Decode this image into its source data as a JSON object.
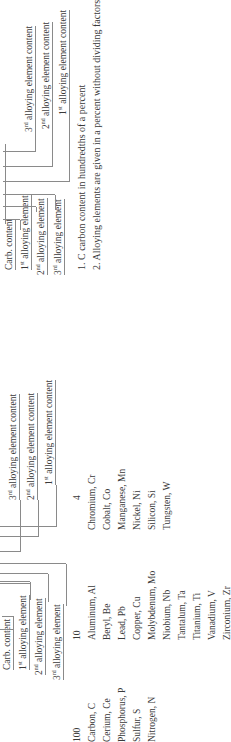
{
  "left_diagram": {
    "carb_content": "Carb. content",
    "element_labels": [
      {
        "ordinal": "1",
        "suffix": "st",
        "text": "alloying element"
      },
      {
        "ordinal": "2",
        "suffix": "nd",
        "text": "alloying element"
      },
      {
        "ordinal": "3",
        "suffix": "rd",
        "text": "alloying element"
      }
    ],
    "content_labels": [
      {
        "ordinal": "3",
        "suffix": "rd",
        "text": "alloying element content"
      },
      {
        "ordinal": "2",
        "suffix": "nd",
        "text": "alloying element content"
      },
      {
        "ordinal": "1",
        "suffix": "st",
        "text": "alloying element content"
      }
    ]
  },
  "right_diagram": {
    "carb_content": "Carb. content",
    "element_labels": [
      {
        "ordinal": "1",
        "suffix": "st",
        "text": "alloying element"
      },
      {
        "ordinal": "2",
        "suffix": "nd",
        "text": "alloying element"
      },
      {
        "ordinal": "3",
        "suffix": "rd",
        "text": "alloying element"
      }
    ],
    "content_labels": [
      {
        "ordinal": "3",
        "suffix": "rd",
        "text": "alloying element content"
      },
      {
        "ordinal": "2",
        "suffix": "nd",
        "text": "alloying element content"
      },
      {
        "ordinal": "1",
        "suffix": "st",
        "text": "alloying element content"
      }
    ]
  },
  "factor_columns": [
    {
      "factor": "100",
      "elements": [
        "Carbon, C",
        "Cerium, Ce",
        "Phosphorus, P",
        "Sulfur, S",
        "Nitrogen, N"
      ]
    },
    {
      "factor": "10",
      "elements": [
        "Aluminum, Al",
        "Beryl, Be",
        "Lead, Pb",
        "Copper, Cu",
        "Molybdenum, Mo",
        "Niobium, Nb",
        "Tantalum, Ta",
        "Titanium, Ti",
        "Vanadium, V",
        "Zirconium, Zr"
      ]
    },
    {
      "factor": "4",
      "elements": [
        "Chromium, Cr",
        "Cobalt, Co",
        "Manganese, Mn",
        "Nickel, Ni",
        "Silicon, Si",
        "Tungsten, W"
      ]
    }
  ],
  "notes": [
    "1. C carbon content in hundredths of a percent",
    "2. Alloying elements are given in a percent without dividing factors"
  ]
}
